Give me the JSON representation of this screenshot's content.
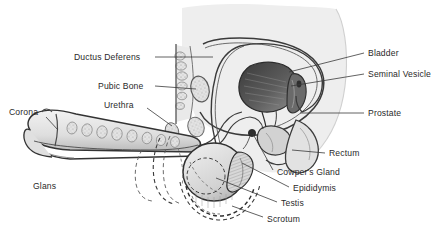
{
  "figure": {
    "background_color": "#ffffff",
    "ink_color": "#2a2a2a",
    "body_fill": "#eeeeee",
    "organ_fill": "#dcdcdc",
    "shadow_fill": "#4a4a4a",
    "bottom_caption": ""
  },
  "labels": [
    {
      "id": "ductus-deferens",
      "text": "Ductus Deferens",
      "x": 74,
      "y": 52,
      "align": "right-anchor",
      "leader": {
        "x1": 155,
        "y1": 57,
        "x2": 213,
        "y2": 57
      }
    },
    {
      "id": "pubic-bone",
      "text": "Pubic Bone",
      "x": 98,
      "y": 81,
      "align": "right-anchor",
      "leader": {
        "x1": 155,
        "y1": 86,
        "x2": 196,
        "y2": 89
      }
    },
    {
      "id": "urethra",
      "text": "Urethra",
      "x": 104,
      "y": 100,
      "align": "right-anchor",
      "leader": {
        "x1": 147,
        "y1": 108,
        "x2": 172,
        "y2": 126
      }
    },
    {
      "id": "corona",
      "text": "Corona",
      "x": 9,
      "y": 107,
      "align": "left",
      "leader": {
        "x1": 46,
        "y1": 117,
        "x2": 58,
        "y2": 130
      }
    },
    {
      "id": "glans",
      "text": "Glans",
      "x": 33,
      "y": 181,
      "align": "left",
      "leader": null
    },
    {
      "id": "bladder",
      "text": "Bladder",
      "x": 368,
      "y": 48,
      "align": "left",
      "leader": {
        "x1": 364,
        "y1": 53,
        "x2": 289,
        "y2": 72
      }
    },
    {
      "id": "seminal-vesicle",
      "text": "Seminal Vesicle",
      "x": 368,
      "y": 69,
      "align": "left",
      "leader": {
        "x1": 364,
        "y1": 74,
        "x2": 291,
        "y2": 86
      }
    },
    {
      "id": "prostate",
      "text": "Prostate",
      "x": 368,
      "y": 108,
      "align": "left",
      "leader": {
        "x1": 364,
        "y1": 113,
        "x2": 300,
        "y2": 113
      }
    },
    {
      "id": "rectum",
      "text": "Rectum",
      "x": 329,
      "y": 148,
      "align": "left",
      "leader": {
        "x1": 325,
        "y1": 153,
        "x2": 292,
        "y2": 150
      }
    },
    {
      "id": "cowpers-gland",
      "text": "Cowper's Gland",
      "x": 277,
      "y": 167,
      "align": "left",
      "leader": {
        "x1": 273,
        "y1": 170,
        "x2": 253,
        "y2": 134
      }
    },
    {
      "id": "epididymis",
      "text": "Epididymis",
      "x": 293,
      "y": 183,
      "align": "left",
      "leader": {
        "x1": 289,
        "y1": 187,
        "x2": 242,
        "y2": 163
      }
    },
    {
      "id": "testis",
      "text": "Testis",
      "x": 281,
      "y": 198,
      "align": "left",
      "leader": {
        "x1": 277,
        "y1": 202,
        "x2": 216,
        "y2": 178
      }
    },
    {
      "id": "scrotum",
      "text": "Scrotum",
      "x": 267,
      "y": 214,
      "align": "left",
      "leader": {
        "x1": 263,
        "y1": 217,
        "x2": 232,
        "y2": 206
      }
    }
  ]
}
